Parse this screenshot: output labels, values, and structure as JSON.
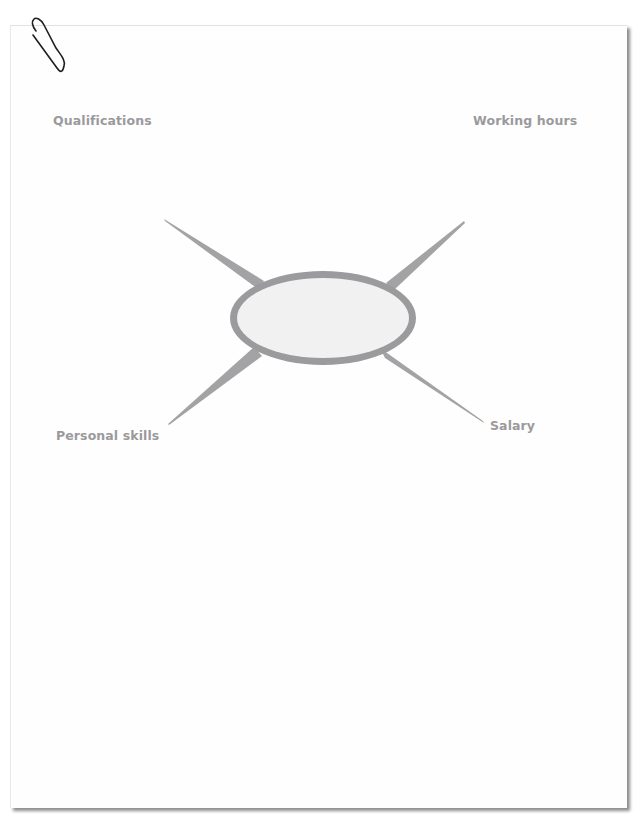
{
  "diagram": {
    "type": "mind-map",
    "center": {
      "text": ""
    },
    "branches": [
      {
        "id": "qualifications",
        "label": "Qualifications",
        "position": "top-left"
      },
      {
        "id": "working-hours",
        "label": "Working hours",
        "position": "top-right"
      },
      {
        "id": "personal-skills",
        "label": "Personal skills",
        "position": "bottom-left"
      },
      {
        "id": "salary",
        "label": "Salary",
        "position": "bottom-right"
      }
    ],
    "colors": {
      "branch": "#a3a3a5",
      "ring": "#9b9b9d",
      "center_fill": "#f1f1f2",
      "label": "#9a9a9c"
    }
  }
}
